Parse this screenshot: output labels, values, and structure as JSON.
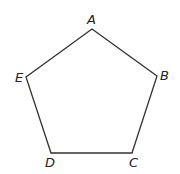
{
  "diagram": {
    "type": "pentagon",
    "stroke_color": "#333333",
    "label_color": "#222222",
    "vertices": [
      {
        "name": "A",
        "x": 92,
        "y": 29,
        "label_x": 87,
        "label_y": 24
      },
      {
        "name": "B",
        "x": 157,
        "y": 76,
        "label_x": 160,
        "label_y": 80
      },
      {
        "name": "C",
        "x": 132,
        "y": 153,
        "label_x": 129,
        "label_y": 167
      },
      {
        "name": "D",
        "x": 51,
        "y": 153,
        "label_x": 45,
        "label_y": 167
      },
      {
        "name": "E",
        "x": 26,
        "y": 77,
        "label_x": 15,
        "label_y": 82
      }
    ]
  }
}
